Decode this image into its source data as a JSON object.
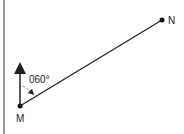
{
  "diagram": {
    "points": [
      {
        "label": "M",
        "x": 20,
        "y": 106
      },
      {
        "label": "N",
        "x": 162,
        "y": 20
      }
    ],
    "bearing_label": "060°",
    "north_arrow": true,
    "colors": {
      "line": "#222222",
      "dash": "#777777"
    }
  }
}
